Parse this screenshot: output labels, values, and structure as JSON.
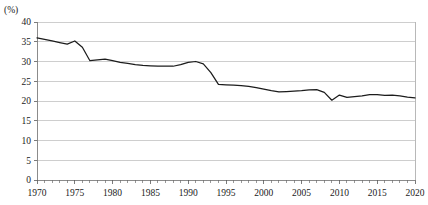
{
  "chart_data": {
    "type": "line",
    "title": "",
    "subtitle": "",
    "xlabel": "",
    "ylabel": "",
    "unit_label": "(%)",
    "xlim": [
      1970,
      2020
    ],
    "ylim": [
      0,
      40
    ],
    "ytick_step": 5,
    "xtick_step": 1,
    "xlabel_step": 5,
    "grid": true,
    "legend": null,
    "legend_position": "none",
    "ytick_labels": [
      "0",
      "5",
      "10",
      "15",
      "20",
      "25",
      "30",
      "35",
      "40"
    ],
    "ytick_values": [
      0,
      5,
      10,
      15,
      20,
      25,
      30,
      35,
      40
    ],
    "xtick_labels": [
      "1970",
      "1975",
      "1980",
      "1985",
      "1990",
      "1995",
      "2000",
      "2005",
      "2010",
      "2015",
      "2020"
    ],
    "xtick_values": [
      1970,
      1975,
      1980,
      1985,
      1990,
      1995,
      2000,
      2005,
      2010,
      2015,
      2020
    ],
    "series": [
      {
        "name": "share",
        "color": "#1c1c1c",
        "x": [
          1970,
          1971,
          1972,
          1973,
          1974,
          1975,
          1976,
          1977,
          1978,
          1979,
          1980,
          1981,
          1982,
          1983,
          1984,
          1985,
          1986,
          1987,
          1988,
          1989,
          1990,
          1991,
          1992,
          1993,
          1994,
          1995,
          1996,
          1997,
          1998,
          1999,
          2000,
          2001,
          2002,
          2003,
          2004,
          2005,
          2006,
          2007,
          2008,
          2009,
          2010,
          2011,
          2012,
          2013,
          2014,
          2015,
          2016,
          2017,
          2018,
          2019,
          2020
        ],
        "values": [
          36.0,
          35.6,
          35.2,
          34.8,
          34.4,
          35.2,
          33.6,
          30.2,
          30.4,
          30.6,
          30.2,
          29.8,
          29.5,
          29.2,
          29.0,
          28.9,
          28.8,
          28.8,
          28.8,
          29.2,
          29.8,
          30.0,
          29.4,
          27.2,
          24.2,
          24.1,
          24.0,
          23.9,
          23.7,
          23.4,
          23.0,
          22.6,
          22.3,
          22.4,
          22.5,
          22.6,
          22.8,
          22.9,
          22.2,
          20.2,
          21.5,
          20.9,
          21.1,
          21.3,
          21.6,
          21.6,
          21.4,
          21.5,
          21.3,
          21.0,
          20.8
        ]
      }
    ]
  },
  "geometry": {
    "plot_left": 37,
    "plot_right": 415,
    "plot_top": 22,
    "plot_bottom": 180,
    "unit_label_x": 4,
    "unit_label_y": 13
  }
}
